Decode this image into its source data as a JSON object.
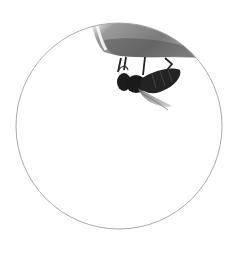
{
  "image": {
    "description": "Grayscale photo of a bee hanging beneath a surface, cropped into a circular frame",
    "subject": "bee",
    "frame_shape": "circle",
    "colors": {
      "background": "#ffffff",
      "frame_stroke": "#9a9a9a",
      "surface_light": "#d8d8d8",
      "surface_dark": "#5a5a5a",
      "bee_body": "#1e1e1e",
      "wing": "#8a8a8a"
    }
  }
}
